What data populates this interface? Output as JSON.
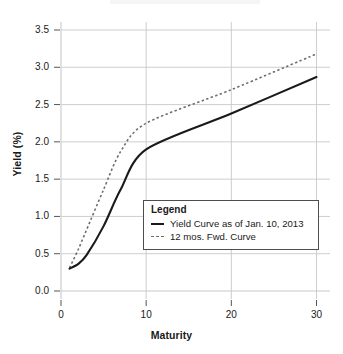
{
  "chart_data": {
    "type": "line",
    "title": "",
    "subtitle": "",
    "xlabel": "Maturity",
    "ylabel": "Yield (%)",
    "xlim": [
      -0.9,
      32.0
    ],
    "ylim": [
      -0.18,
      3.62
    ],
    "xticks": [
      0,
      10,
      20,
      30
    ],
    "xtick_labels": [
      "0",
      "10",
      "20",
      "30"
    ],
    "yticks": [
      0.0,
      0.5,
      1.0,
      1.5,
      2.0,
      2.5,
      3.0,
      3.5
    ],
    "ytick_labels": [
      "0.0",
      "0.5",
      "1.0",
      "1.5",
      "2.0",
      "2.5",
      "3.0",
      "3.5"
    ],
    "grid": true,
    "grid_color": "#c8c8c8",
    "legend_position": "center-right",
    "series": [
      {
        "name": "Yield Curve as of Jan. 10, 2013",
        "style": "solid",
        "color": "#1a1a1a",
        "x": [
          1,
          2,
          3,
          5,
          7,
          10,
          20,
          30
        ],
        "values": [
          0.3,
          0.36,
          0.48,
          0.87,
          1.36,
          1.9,
          2.38,
          2.87
        ]
      },
      {
        "name": "12 mos. Fwd. Curve",
        "style": "dashed",
        "color": "#6e6e6e",
        "x": [
          1,
          2,
          3,
          5,
          7,
          10,
          20,
          30
        ],
        "values": [
          0.31,
          0.55,
          0.82,
          1.36,
          1.87,
          2.25,
          2.7,
          3.18
        ]
      }
    ]
  },
  "axes": {
    "y_title": "Yield (%)",
    "x_title": "Maturity"
  },
  "legend": {
    "title": "Legend",
    "entries": [
      {
        "label": "Yield Curve as of Jan. 10, 2013",
        "style": "solid"
      },
      {
        "label": "12 mos. Fwd. Curve",
        "style": "dashed"
      }
    ]
  },
  "colors": {
    "solid_series": "#1a1a1a",
    "dashed_series": "#6e6e6e",
    "grid": "#c8c8c8",
    "axis": "#999999",
    "text": "#1a1a1a",
    "background": "#ffffff"
  }
}
